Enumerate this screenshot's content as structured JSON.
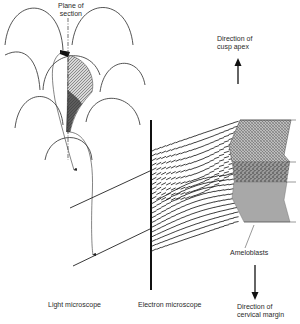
{
  "labels": {
    "plane_of_section": "Plane of\nsection",
    "direction_cusp_apex": "Direction of\ncusp apex",
    "ameloblasts": "Ameloblasts",
    "light_microscope": "Light microscope",
    "electron_microscope": "Electron microscope",
    "direction_cervical_margin": "Direction of\ncervical margin"
  },
  "colors": {
    "line": "#222222",
    "enamel_stipple_dark": "#555555",
    "ameloblast_gray": "#a8a8a8",
    "hatch_gray": "#8c8c8c"
  }
}
